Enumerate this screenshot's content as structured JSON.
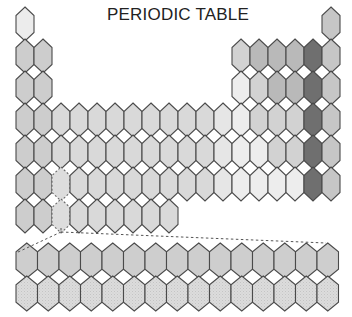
{
  "title": "PERIODIC TABLE",
  "colors": {
    "outline": "#4a4a4a",
    "hydrogen": "#ececec",
    "s_block": "#cdcdcd",
    "d_block": "#d9d9d9",
    "d_block_light": "#e6e6e6",
    "p_block_light": "#ededed",
    "p_block_mid": "#d2d2d2",
    "p_block_dark": "#b9b9b9",
    "halogen": "#6f6f6f",
    "noble_gas": "#c6c6c6",
    "f_block_lanthanides": "#cecece",
    "f_block_actinides": "#dcdcdc",
    "placeholder": "#dddddd"
  },
  "main_grid": {
    "origin_x": 16,
    "origin_y": 7,
    "col_width": 18,
    "row_step": 32,
    "hex_height": 34,
    "cells": [
      {
        "r": 1,
        "c": 1,
        "shade": "hydrogen"
      },
      {
        "r": 1,
        "c": 18,
        "shade": "noble_gas"
      },
      {
        "r": 2,
        "c": 1,
        "shade": "s_block"
      },
      {
        "r": 2,
        "c": 2,
        "shade": "s_block"
      },
      {
        "r": 2,
        "c": 13,
        "shade": "p_block_mid"
      },
      {
        "r": 2,
        "c": 14,
        "shade": "p_block_dark"
      },
      {
        "r": 2,
        "c": 15,
        "shade": "p_block_dark"
      },
      {
        "r": 2,
        "c": 16,
        "shade": "p_block_dark"
      },
      {
        "r": 2,
        "c": 17,
        "shade": "halogen"
      },
      {
        "r": 2,
        "c": 18,
        "shade": "noble_gas"
      },
      {
        "r": 3,
        "c": 1,
        "shade": "s_block"
      },
      {
        "r": 3,
        "c": 2,
        "shade": "s_block"
      },
      {
        "r": 3,
        "c": 13,
        "shade": "p_block_light"
      },
      {
        "r": 3,
        "c": 14,
        "shade": "p_block_mid"
      },
      {
        "r": 3,
        "c": 15,
        "shade": "p_block_dark"
      },
      {
        "r": 3,
        "c": 16,
        "shade": "p_block_dark"
      },
      {
        "r": 3,
        "c": 17,
        "shade": "halogen"
      },
      {
        "r": 3,
        "c": 18,
        "shade": "noble_gas"
      },
      {
        "r": 4,
        "c": 1,
        "shade": "s_block"
      },
      {
        "r": 4,
        "c": 2,
        "shade": "s_block"
      },
      {
        "r": 4,
        "c": 3,
        "shade": "d_block"
      },
      {
        "r": 4,
        "c": 4,
        "shade": "d_block"
      },
      {
        "r": 4,
        "c": 5,
        "shade": "d_block"
      },
      {
        "r": 4,
        "c": 6,
        "shade": "d_block"
      },
      {
        "r": 4,
        "c": 7,
        "shade": "d_block"
      },
      {
        "r": 4,
        "c": 8,
        "shade": "d_block"
      },
      {
        "r": 4,
        "c": 9,
        "shade": "d_block"
      },
      {
        "r": 4,
        "c": 10,
        "shade": "d_block"
      },
      {
        "r": 4,
        "c": 11,
        "shade": "d_block"
      },
      {
        "r": 4,
        "c": 12,
        "shade": "d_block_light"
      },
      {
        "r": 4,
        "c": 13,
        "shade": "p_block_light"
      },
      {
        "r": 4,
        "c": 14,
        "shade": "p_block_mid"
      },
      {
        "r": 4,
        "c": 15,
        "shade": "p_block_mid"
      },
      {
        "r": 4,
        "c": 16,
        "shade": "p_block_mid"
      },
      {
        "r": 4,
        "c": 17,
        "shade": "halogen"
      },
      {
        "r": 4,
        "c": 18,
        "shade": "noble_gas"
      },
      {
        "r": 5,
        "c": 1,
        "shade": "s_block"
      },
      {
        "r": 5,
        "c": 2,
        "shade": "s_block"
      },
      {
        "r": 5,
        "c": 3,
        "shade": "d_block"
      },
      {
        "r": 5,
        "c": 4,
        "shade": "d_block"
      },
      {
        "r": 5,
        "c": 5,
        "shade": "d_block"
      },
      {
        "r": 5,
        "c": 6,
        "shade": "d_block"
      },
      {
        "r": 5,
        "c": 7,
        "shade": "d_block"
      },
      {
        "r": 5,
        "c": 8,
        "shade": "d_block"
      },
      {
        "r": 5,
        "c": 9,
        "shade": "d_block"
      },
      {
        "r": 5,
        "c": 10,
        "shade": "d_block"
      },
      {
        "r": 5,
        "c": 11,
        "shade": "d_block"
      },
      {
        "r": 5,
        "c": 12,
        "shade": "d_block_light"
      },
      {
        "r": 5,
        "c": 13,
        "shade": "p_block_light"
      },
      {
        "r": 5,
        "c": 14,
        "shade": "p_block_light"
      },
      {
        "r": 5,
        "c": 15,
        "shade": "p_block_mid"
      },
      {
        "r": 5,
        "c": 16,
        "shade": "p_block_mid"
      },
      {
        "r": 5,
        "c": 17,
        "shade": "halogen"
      },
      {
        "r": 5,
        "c": 18,
        "shade": "noble_gas"
      },
      {
        "r": 6,
        "c": 1,
        "shade": "s_block"
      },
      {
        "r": 6,
        "c": 2,
        "shade": "s_block"
      },
      {
        "r": 6,
        "c": 3,
        "shade": "placeholder",
        "dashed": true
      },
      {
        "r": 6,
        "c": 4,
        "shade": "d_block"
      },
      {
        "r": 6,
        "c": 5,
        "shade": "d_block"
      },
      {
        "r": 6,
        "c": 6,
        "shade": "d_block"
      },
      {
        "r": 6,
        "c": 7,
        "shade": "d_block"
      },
      {
        "r": 6,
        "c": 8,
        "shade": "d_block"
      },
      {
        "r": 6,
        "c": 9,
        "shade": "d_block"
      },
      {
        "r": 6,
        "c": 10,
        "shade": "d_block"
      },
      {
        "r": 6,
        "c": 11,
        "shade": "d_block"
      },
      {
        "r": 6,
        "c": 12,
        "shade": "d_block_light"
      },
      {
        "r": 6,
        "c": 13,
        "shade": "p_block_light"
      },
      {
        "r": 6,
        "c": 14,
        "shade": "p_block_light"
      },
      {
        "r": 6,
        "c": 15,
        "shade": "p_block_light"
      },
      {
        "r": 6,
        "c": 16,
        "shade": "p_block_light"
      },
      {
        "r": 6,
        "c": 17,
        "shade": "halogen"
      },
      {
        "r": 6,
        "c": 18,
        "shade": "noble_gas"
      },
      {
        "r": 7,
        "c": 1,
        "shade": "s_block"
      },
      {
        "r": 7,
        "c": 2,
        "shade": "s_block"
      },
      {
        "r": 7,
        "c": 3,
        "shade": "placeholder",
        "dashed": true
      },
      {
        "r": 7,
        "c": 4,
        "shade": "d_block"
      },
      {
        "r": 7,
        "c": 5,
        "shade": "d_block"
      },
      {
        "r": 7,
        "c": 6,
        "shade": "d_block"
      },
      {
        "r": 7,
        "c": 7,
        "shade": "d_block"
      },
      {
        "r": 7,
        "c": 8,
        "shade": "d_block"
      },
      {
        "r": 7,
        "c": 9,
        "shade": "d_block"
      }
    ]
  },
  "f_block": {
    "origin_x": 16,
    "origin_y": 243,
    "col_width": 21.5,
    "row_step": 33,
    "hex_height": 35,
    "rows": [
      {
        "label": "lanthanides",
        "count": 15,
        "shade": "f_block_lanthanides"
      },
      {
        "label": "actinides",
        "count": 15,
        "shade": "f_block_actinides"
      }
    ]
  },
  "connector": {
    "from": [
      61,
      232
    ],
    "to_left": [
      16,
      253
    ],
    "to_right": [
      326,
      243
    ]
  }
}
